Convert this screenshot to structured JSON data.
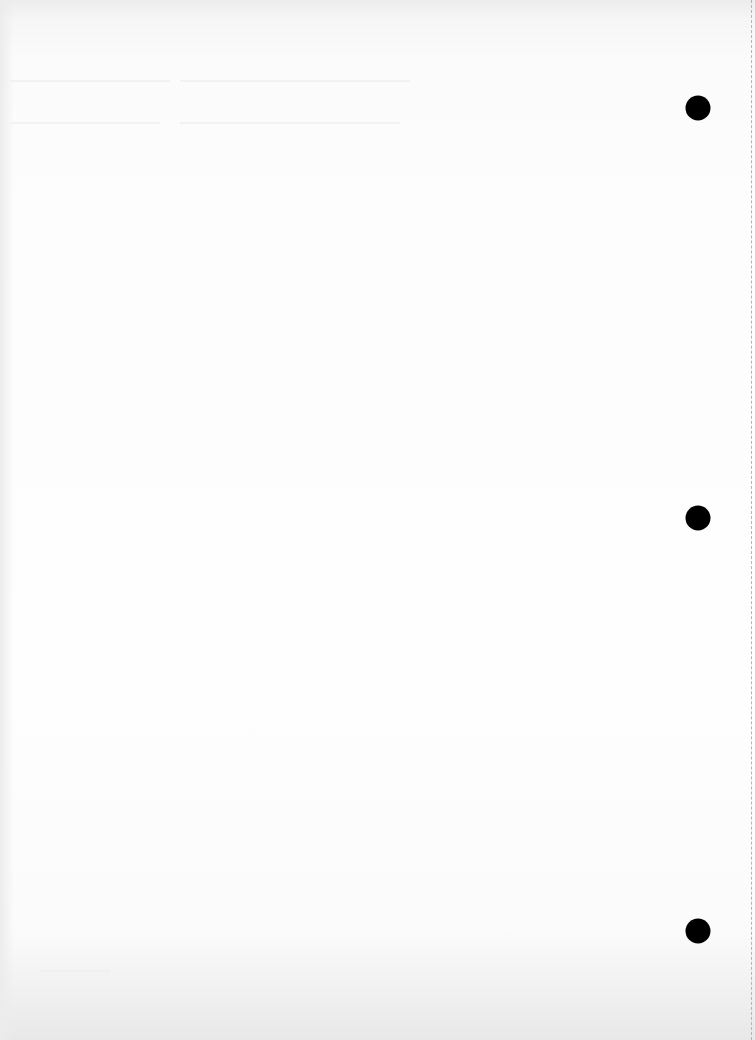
{
  "document": {
    "type": "blank scanned page",
    "paper_color": "#fdfdfd",
    "hole_color": "#000000",
    "perforation_color": "#b5b5b5"
  },
  "holes": [
    {
      "x": 698,
      "y": 108
    },
    {
      "x": 698,
      "y": 518
    },
    {
      "x": 698,
      "y": 931
    }
  ]
}
